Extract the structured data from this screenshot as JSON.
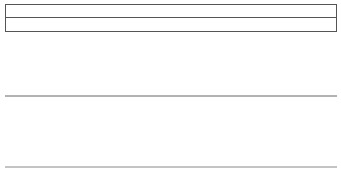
{
  "sectors": {
    "row1": [
      {
        "label": "Technology",
        "width": 95
      },
      {
        "label": "Basic Industry",
        "width": 85
      },
      {
        "label": "Staples",
        "width": 63
      },
      {
        "label": "Utilities",
        "width": 89
      }
    ],
    "row2": [
      {
        "label": "Cyclicals",
        "width": 64
      },
      {
        "label": "Industrial",
        "width": 70
      },
      {
        "label": "Energy",
        "width": 75
      },
      {
        "label": "Services",
        "width": 69
      },
      {
        "label": "Finance",
        "width": 54
      }
    ]
  },
  "phases": [
    {
      "label": "Market Bottom",
      "x": 7
    },
    {
      "label": "Bull Market",
      "x": 96
    },
    {
      "label": "Market Top",
      "x": 172
    },
    {
      "label": "Bear Market",
      "x": 254
    }
  ],
  "legend": "Legend: Market Cycle I Economic Cycle",
  "colors": {
    "fill": "#cfcfcf",
    "line": "#222222",
    "baseline": "#666666"
  },
  "chart_data": {
    "type": "line",
    "title": "",
    "series": [
      {
        "name": "Market Cycle",
        "description": "sine wave starting at trough near left edge, peaks near Market Top region (~x=175)"
      },
      {
        "name": "Economic Cycle",
        "description": "lagging sine wave, starts at mid-line descending, trough ~x=90, peaks ~x=248"
      }
    ],
    "x_labels": [
      "Market Bottom",
      "Bull Market",
      "Market Top",
      "Bear Market"
    ],
    "legend": [
      "Market Cycle",
      "Economic Cycle"
    ]
  }
}
